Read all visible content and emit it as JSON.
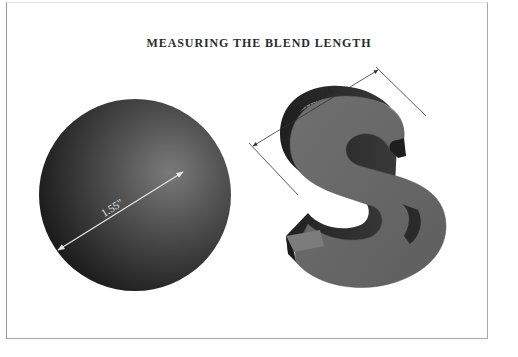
{
  "title": "MEASURING THE BLEND LENGTH",
  "sphere": {
    "measurement_label": "1.55\"",
    "fill_dark": "#1c1c1c",
    "fill_light": "#6e6e6e",
    "arrow_color": "#e6e6e6"
  },
  "letter_s": {
    "glyph": "S",
    "dimension_label": "ESTIMATE",
    "face_color": "#6b6b6b",
    "side_color": "#2a2a2a",
    "top_color": "#8a8a8a",
    "dimension_line_color": "#333333"
  },
  "frame": {
    "border_color": "#a8a8a8"
  }
}
